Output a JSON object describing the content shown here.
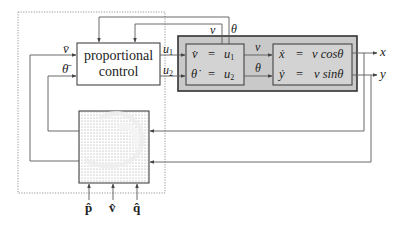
{
  "diagram": {
    "controller": {
      "line1": "proportional",
      "line2": "control"
    },
    "controller_inputs": {
      "v_ref": "v̄",
      "theta_ref": "θ̄"
    },
    "controller_outputs": {
      "u1": "u",
      "u1_sub": "1",
      "u2": "u",
      "u2_sub": "2"
    },
    "feedback_labels": {
      "v": "v",
      "theta": "θ"
    },
    "dynamics_block": {
      "eq1_lhs": "v̇",
      "eq1_eq": "=",
      "eq1_rhs": "u",
      "eq1_rhs_sub": "1",
      "eq2_lhs": "θ̇",
      "eq2_eq": "=",
      "eq2_rhs": "u",
      "eq2_rhs_sub": "2"
    },
    "intermediate_labels": {
      "v": "v",
      "theta": "θ"
    },
    "kinematics_block": {
      "eq1_lhs": "ẋ",
      "eq1_eq": "=",
      "eq1_rhs": "v cosθ",
      "eq2_lhs": "ẏ",
      "eq2_eq": "=",
      "eq2_rhs": "v sinθ"
    },
    "outputs": {
      "x": "x",
      "y": "y"
    },
    "vector_field_inputs": {
      "p": "p̂",
      "v": "v̂",
      "q": "q̂"
    },
    "colors": {
      "line": "#555555",
      "outer_block_fill": "#c8c8c8",
      "outer_block_border": "#333333",
      "inner_block_fill": "#d4d4d4",
      "dotted_border": "#888888"
    }
  }
}
